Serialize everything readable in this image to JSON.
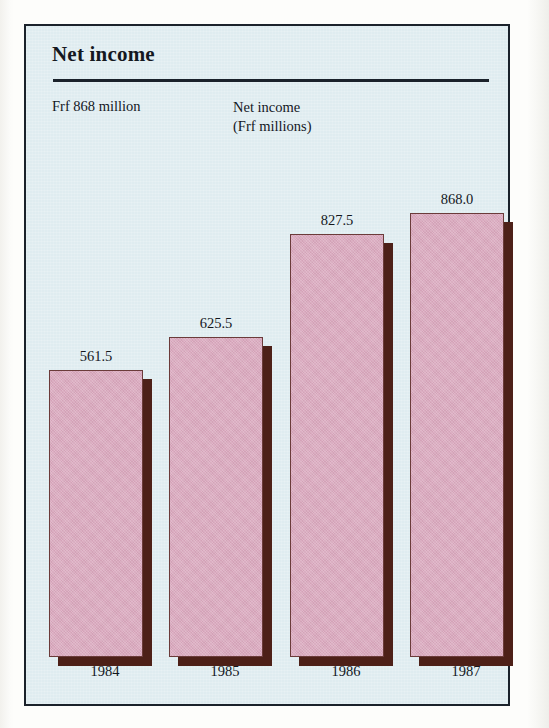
{
  "figure": {
    "title": "Net income",
    "caption": "Frf 868 million",
    "axis_label_line1": "Net income",
    "axis_label_line2": "(Frf millions)"
  },
  "colors": {
    "panel_background": "#dfecf0",
    "panel_border": "#1b222b",
    "bar_fill": "#dbabc0",
    "bar_outline": "#6b3b3a",
    "bar_shadow": "#4d2018",
    "text": "#14181f",
    "page_background": "#fdfdfb"
  },
  "chart_data": {
    "type": "bar",
    "title": "Net income",
    "xlabel": "",
    "ylabel": "Net income (Frf millions)",
    "categories": [
      "1984",
      "1985",
      "1986",
      "1987"
    ],
    "values": [
      561.5,
      625.5,
      827.5,
      868.0
    ],
    "value_labels": [
      "561.5",
      "625.5",
      "827.5",
      "868.0"
    ],
    "ylim": [
      0,
      960
    ],
    "grid": false,
    "legend": null,
    "annotations": [
      "Frf 868 million",
      "Net income (Frf millions)"
    ]
  }
}
